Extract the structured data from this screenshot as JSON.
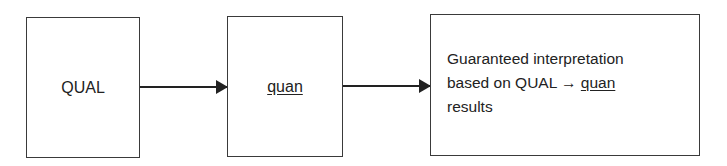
{
  "diagram": {
    "nodes": [
      {
        "id": "qual",
        "label": "QUAL",
        "underline": false
      },
      {
        "id": "quan",
        "label": "quan",
        "underline": true
      },
      {
        "id": "result",
        "lines": [
          "Guaranteed interpretation",
          "based on QUAL",
          "→",
          "quan",
          "results"
        ]
      }
    ],
    "edges": [
      {
        "from": "qual",
        "to": "quan"
      },
      {
        "from": "quan",
        "to": "result"
      }
    ]
  }
}
